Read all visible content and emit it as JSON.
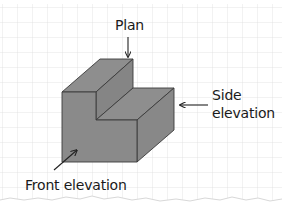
{
  "diagram": {
    "type": "orthographic-views",
    "labels": {
      "plan": "Plan",
      "side_line1": "Side",
      "side_line2": "elevation",
      "front": "Front elevation"
    },
    "colors": {
      "paper": "#ffffff",
      "grid": "#dcdcdc",
      "solid_face": "#8a8a8a",
      "solid_edge": "#3a3a3a",
      "text": "#1a1a1a",
      "arrow": "#222222"
    }
  }
}
